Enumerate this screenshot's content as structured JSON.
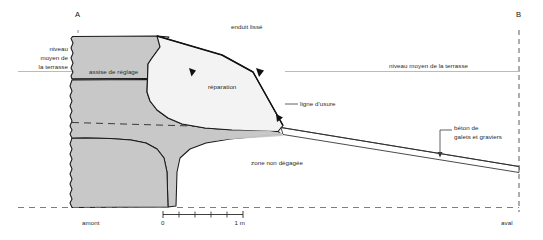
{
  "figure": {
    "type": "cross-section",
    "orientation_markers": {
      "left": "A",
      "right": "B"
    }
  },
  "section_markers": {
    "a": "A",
    "b": "B"
  },
  "labels": {
    "niveau_left": "niveau\nmoyen de\nla terrasse",
    "niveau_left_line1": "niveau",
    "niveau_left_line2": "moyen de",
    "niveau_left_line3": "la terrasse",
    "assise": "assise de réglage",
    "enduit": "enduit lissé",
    "reparation": "réparation",
    "niveau_right": "niveau moyen de la terrasse",
    "ligne_usure": "ligne d'usure",
    "beton_line1": "béton de",
    "beton_line2": "galets et graviers",
    "zone": "zone non dégagée",
    "amont": "amont",
    "aval": "aval"
  },
  "scale_bar": {
    "start_label": "0",
    "end_label": "1 m",
    "ticks": 5
  },
  "colors": {
    "masonry_fill": "#c9c9c9",
    "repair_fill": "#f2f2f2",
    "beton_fill": "#ffffff",
    "stroke": "#1a1a1a",
    "level_line": "#9a9a9a",
    "text": "#2a2a2a"
  }
}
